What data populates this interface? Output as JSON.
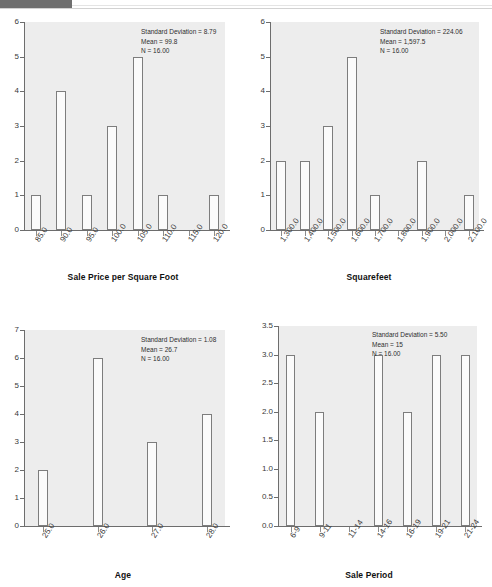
{
  "charts": [
    {
      "id": "sale-price-per-square-foot",
      "xlabel": "Sale Price per Square Foot",
      "stats": {
        "sd": "Standard Deviation = 8.79",
        "mean": "Mean = 99.8",
        "n": "N = 16.00"
      },
      "yticks": [
        "0",
        "1",
        "2",
        "3",
        "4",
        "5",
        "6"
      ],
      "xticks": [
        "85.0",
        "90.0",
        "95.0",
        "100.0",
        "105.0",
        "110.0",
        "115.0",
        "120.0"
      ],
      "values": [
        1,
        4,
        1,
        3,
        5,
        1,
        0,
        1
      ]
    },
    {
      "id": "squarefeet",
      "xlabel": "Squarefeet",
      "stats": {
        "sd": "Standard Deviation = 224.06",
        "mean": "Mean = 1,597.5",
        "n": "N = 16.00"
      },
      "yticks": [
        "0",
        "1",
        "2",
        "3",
        "4",
        "5",
        "6"
      ],
      "xticks": [
        "1,300.0",
        "1,400.0",
        "1,500.0",
        "1,600.0",
        "1,700.0",
        "1,800.0",
        "1,900.0",
        "2,000.0",
        "2,100.0"
      ],
      "values": [
        2,
        2,
        3,
        5,
        1,
        0,
        2,
        0,
        1
      ]
    },
    {
      "id": "age",
      "xlabel": "Age",
      "stats": {
        "sd": "Standard Deviation = 1.08",
        "mean": "Mean = 26.7",
        "n": "N = 16.00"
      },
      "yticks": [
        "0",
        "1",
        "2",
        "3",
        "4",
        "5",
        "6",
        "7"
      ],
      "xticks": [
        "25.0",
        "26.0",
        "27.0",
        "28.0"
      ],
      "values": [
        2,
        6,
        3,
        4
      ]
    },
    {
      "id": "sale-period",
      "xlabel": "Sale Period",
      "stats": {
        "sd": "Standard Deviation = 5.50",
        "mean": "Mean = 15",
        "n": "N = 16.00"
      },
      "yticks": [
        "0.0",
        "0.5",
        "1.0",
        "1.5",
        "2.0",
        "2.5",
        "3.0",
        "3.5"
      ],
      "xticks": [
        "6-9",
        "9-11",
        "11-14",
        "14-16",
        "16-19",
        "19-21",
        "21-24"
      ],
      "values": [
        3,
        2,
        0,
        3,
        2,
        3,
        3
      ]
    }
  ],
  "chart_data": [
    {
      "type": "bar",
      "title": "",
      "xlabel": "Sale Price per Square Foot",
      "ylabel": "",
      "categories": [
        "85.0",
        "90.0",
        "95.0",
        "100.0",
        "105.0",
        "110.0",
        "115.0",
        "120.0"
      ],
      "values": [
        1,
        4,
        1,
        3,
        5,
        1,
        0,
        1
      ],
      "ylim": [
        0,
        6
      ],
      "yticks": [
        0,
        1,
        2,
        3,
        4,
        5,
        6
      ],
      "grid": false,
      "legend": "none",
      "annotations": [
        "Standard Deviation = 8.79",
        "Mean = 99.8",
        "N = 16.00"
      ]
    },
    {
      "type": "bar",
      "title": "",
      "xlabel": "Squarefeet",
      "ylabel": "",
      "categories": [
        "1,300.0",
        "1,400.0",
        "1,500.0",
        "1,600.0",
        "1,700.0",
        "1,800.0",
        "1,900.0",
        "2,000.0",
        "2,100.0"
      ],
      "values": [
        2,
        2,
        3,
        5,
        1,
        0,
        2,
        0,
        1
      ],
      "ylim": [
        0,
        6
      ],
      "yticks": [
        0,
        1,
        2,
        3,
        4,
        5,
        6
      ],
      "grid": false,
      "legend": "none",
      "annotations": [
        "Standard Deviation = 224.06",
        "Mean = 1,597.5",
        "N = 16.00"
      ]
    },
    {
      "type": "bar",
      "title": "",
      "xlabel": "Age",
      "ylabel": "",
      "categories": [
        "25.0",
        "26.0",
        "27.0",
        "28.0"
      ],
      "values": [
        2,
        6,
        3,
        4
      ],
      "ylim": [
        0,
        7
      ],
      "yticks": [
        0,
        1,
        2,
        3,
        4,
        5,
        6,
        7
      ],
      "grid": false,
      "legend": "none",
      "annotations": [
        "Standard Deviation = 1.08",
        "Mean = 26.7",
        "N = 16.00"
      ]
    },
    {
      "type": "bar",
      "title": "",
      "xlabel": "Sale Period",
      "ylabel": "",
      "categories": [
        "6-9",
        "9-11",
        "11-14",
        "14-16",
        "16-19",
        "19-21",
        "21-24"
      ],
      "values": [
        3,
        2,
        0,
        3,
        2,
        3,
        3
      ],
      "ylim": [
        0,
        3.5
      ],
      "yticks": [
        0.0,
        0.5,
        1.0,
        1.5,
        2.0,
        2.5,
        3.0,
        3.5
      ],
      "grid": false,
      "legend": "none",
      "annotations": [
        "Standard Deviation = 5.50",
        "Mean = 15",
        "N = 16.00"
      ]
    }
  ]
}
